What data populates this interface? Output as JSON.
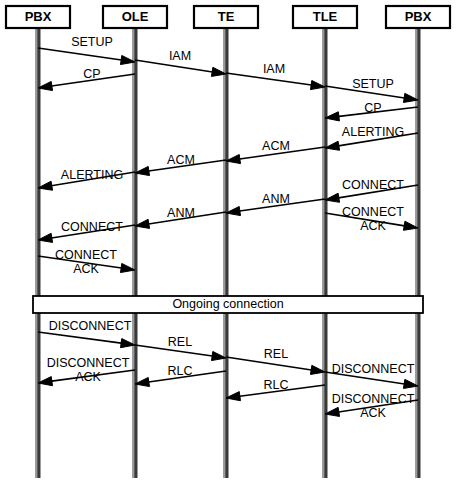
{
  "diagram": {
    "type": "sequence-diagram",
    "width": 457,
    "height": 490,
    "background_color": "#ffffff",
    "line_color": "#000000",
    "lifeline_color": "#3a3a3a"
  },
  "actors": [
    {
      "id": "pbx-left",
      "label": "PBX",
      "x": 38,
      "box_x": 6,
      "box_w": 64
    },
    {
      "id": "ole",
      "label": "OLE",
      "x": 135,
      "box_x": 103,
      "box_w": 64
    },
    {
      "id": "te",
      "label": "TE",
      "x": 226,
      "box_x": 194,
      "box_w": 64
    },
    {
      "id": "tle",
      "label": "TLE",
      "x": 325,
      "box_x": 293,
      "box_w": 64
    },
    {
      "id": "pbx-right",
      "label": "PBX",
      "x": 418,
      "box_x": 386,
      "box_w": 64
    }
  ],
  "actor_box": {
    "y": 6,
    "height": 22
  },
  "lifelines": {
    "top": 28,
    "bottom": 478
  },
  "messages": [
    {
      "id": "m01",
      "label": "SETUP",
      "lines": [
        "SETUP"
      ],
      "from": "pbx-left",
      "to": "ole",
      "dir": "right",
      "y1": 48,
      "y2": 62,
      "label_x": 92,
      "label_y": 43
    },
    {
      "id": "m02",
      "label": "IAM",
      "lines": [
        "IAM"
      ],
      "from": "ole",
      "to": "te",
      "dir": "right",
      "y1": 60,
      "y2": 74,
      "label_x": 180,
      "label_y": 57
    },
    {
      "id": "m03",
      "label": "CP",
      "lines": [
        "CP"
      ],
      "from": "ole",
      "to": "pbx-left",
      "dir": "left",
      "y1": 74,
      "y2": 88,
      "label_x": 92,
      "label_y": 75
    },
    {
      "id": "m04",
      "label": "IAM",
      "lines": [
        "IAM"
      ],
      "from": "te",
      "to": "tle",
      "dir": "right",
      "y1": 73,
      "y2": 87,
      "label_x": 274,
      "label_y": 70
    },
    {
      "id": "m05",
      "label": "SETUP",
      "lines": [
        "SETUP"
      ],
      "from": "tle",
      "to": "pbx-right",
      "dir": "right",
      "y1": 86,
      "y2": 100,
      "label_x": 373,
      "label_y": 85
    },
    {
      "id": "m06",
      "label": "CP",
      "lines": [
        "CP"
      ],
      "from": "pbx-right",
      "to": "tle",
      "dir": "left",
      "y1": 107,
      "y2": 118,
      "label_x": 373,
      "label_y": 109
    },
    {
      "id": "m07",
      "label": "ALERTING",
      "lines": [
        "ALERTING"
      ],
      "from": "pbx-right",
      "to": "tle",
      "dir": "left",
      "y1": 133,
      "y2": 148,
      "label_x": 373,
      "label_y": 133
    },
    {
      "id": "m08",
      "label": "ACM",
      "lines": [
        "ACM"
      ],
      "from": "tle",
      "to": "te",
      "dir": "left",
      "y1": 147,
      "y2": 161,
      "label_x": 276,
      "label_y": 147
    },
    {
      "id": "m09",
      "label": "ACM",
      "lines": [
        "ACM"
      ],
      "from": "te",
      "to": "ole",
      "dir": "left",
      "y1": 160,
      "y2": 173,
      "label_x": 181,
      "label_y": 161
    },
    {
      "id": "m10",
      "label": "ALERTING",
      "lines": [
        "ALERTING"
      ],
      "from": "ole",
      "to": "pbx-left",
      "dir": "left",
      "y1": 172,
      "y2": 188,
      "label_x": 92,
      "label_y": 176
    },
    {
      "id": "m11",
      "label": "CONNECT",
      "lines": [
        "CONNECT"
      ],
      "from": "pbx-right",
      "to": "tle",
      "dir": "left",
      "y1": 185,
      "y2": 200,
      "label_x": 373,
      "label_y": 186
    },
    {
      "id": "m12",
      "label": "ANM",
      "lines": [
        "ANM"
      ],
      "from": "tle",
      "to": "te",
      "dir": "left",
      "y1": 199,
      "y2": 213,
      "label_x": 276,
      "label_y": 200
    },
    {
      "id": "m13",
      "label": "ANM",
      "lines": [
        "ANM"
      ],
      "from": "te",
      "to": "ole",
      "dir": "left",
      "y1": 212,
      "y2": 226,
      "label_x": 181,
      "label_y": 214
    },
    {
      "id": "m14",
      "label": "CONNECT ACK",
      "lines": [
        "CONNECT",
        "ACK"
      ],
      "from": "tle",
      "to": "pbx-right",
      "dir": "right",
      "y1": 213,
      "y2": 228,
      "label_x": 373,
      "label_y": 213
    },
    {
      "id": "m15",
      "label": "CONNECT",
      "lines": [
        "CONNECT"
      ],
      "from": "ole",
      "to": "pbx-left",
      "dir": "left",
      "y1": 225,
      "y2": 240,
      "label_x": 92,
      "label_y": 228
    },
    {
      "id": "m16",
      "label": "CONNECT ACK",
      "lines": [
        "CONNECT",
        "ACK"
      ],
      "from": "pbx-left",
      "to": "ole",
      "dir": "right",
      "y1": 256,
      "y2": 270,
      "label_x": 86,
      "label_y": 256
    },
    {
      "id": "m17",
      "label": "DISCONNECT",
      "lines": [
        "DISCONNECT"
      ],
      "from": "pbx-left",
      "to": "ole",
      "dir": "right",
      "y1": 332,
      "y2": 345,
      "label_x": 90,
      "label_y": 327
    },
    {
      "id": "m18",
      "label": "REL",
      "lines": [
        "REL"
      ],
      "from": "ole",
      "to": "te",
      "dir": "right",
      "y1": 345,
      "y2": 358,
      "label_x": 180,
      "label_y": 343
    },
    {
      "id": "m19",
      "label": "DISCONNECT ACK",
      "lines": [
        "DISCONNECT",
        "ACK"
      ],
      "from": "ole",
      "to": "pbx-left",
      "dir": "left",
      "y1": 370,
      "y2": 383,
      "label_x": 88,
      "label_y": 364
    },
    {
      "id": "m20",
      "label": "REL",
      "lines": [
        "REL"
      ],
      "from": "te",
      "to": "tle",
      "dir": "right",
      "y1": 357,
      "y2": 372,
      "label_x": 276,
      "label_y": 355
    },
    {
      "id": "m21",
      "label": "DISCONNECT",
      "lines": [
        "DISCONNECT"
      ],
      "from": "tle",
      "to": "pbx-right",
      "dir": "right",
      "y1": 372,
      "y2": 386,
      "label_x": 373,
      "label_y": 370
    },
    {
      "id": "m22",
      "label": "RLC",
      "lines": [
        "RLC"
      ],
      "from": "te",
      "to": "ole",
      "dir": "left",
      "y1": 371,
      "y2": 384,
      "label_x": 180,
      "label_y": 372
    },
    {
      "id": "m23",
      "label": "RLC",
      "lines": [
        "RLC"
      ],
      "from": "tle",
      "to": "te",
      "dir": "left",
      "y1": 385,
      "y2": 398,
      "label_x": 276,
      "label_y": 386
    },
    {
      "id": "m24",
      "label": "DISCONNECT ACK",
      "lines": [
        "DISCONNECT",
        "ACK"
      ],
      "from": "pbx-right",
      "to": "tle",
      "dir": "left",
      "y1": 400,
      "y2": 414,
      "label_x": 373,
      "label_y": 400
    }
  ],
  "band": {
    "label": "Ongoing connection",
    "x": 33,
    "y": 296,
    "width": 390,
    "height": 17
  }
}
